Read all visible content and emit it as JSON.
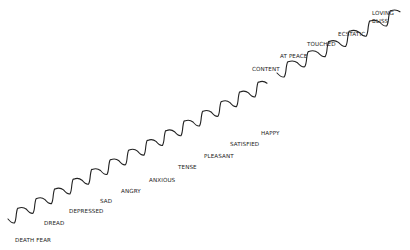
{
  "diagram": {
    "type": "emotional-scale-staircase",
    "line_color": "#222222",
    "text_color": "#222222",
    "lower_path": {
      "start": [
        8,
        219
      ],
      "steps": 14,
      "step_dx": 18.5,
      "step_dy": -9.7
    },
    "upper_path": {
      "start": [
        277,
        73
      ],
      "steps": 6,
      "step_dx": 20.5,
      "step_dy": -10.2
    },
    "labels": [
      {
        "text": "DEATH FEAR",
        "x": 15,
        "y": 237
      },
      {
        "text": "DREAD",
        "x": 44,
        "y": 220
      },
      {
        "text": "DEPRESSED",
        "x": 69,
        "y": 208
      },
      {
        "text": "SAD",
        "x": 100,
        "y": 198
      },
      {
        "text": "ANGRY",
        "x": 121,
        "y": 188
      },
      {
        "text": "ANXIOUS",
        "x": 149,
        "y": 177
      },
      {
        "text": "TENSE",
        "x": 178,
        "y": 164
      },
      {
        "text": "PLEASANT",
        "x": 204,
        "y": 153
      },
      {
        "text": "SATISFIED",
        "x": 230,
        "y": 141
      },
      {
        "text": "HAPPY",
        "x": 261,
        "y": 130
      },
      {
        "text": "CONTENT",
        "x": 252,
        "y": 66
      },
      {
        "text": "AT PEACE",
        "x": 280,
        "y": 53
      },
      {
        "text": "TOUCHED",
        "x": 307,
        "y": 41
      },
      {
        "text": "ECSTATIC",
        "x": 338,
        "y": 31
      },
      {
        "text": "LOVING",
        "x": 372,
        "y": 10
      },
      {
        "text": "BLISS",
        "x": 372,
        "y": 18
      }
    ]
  }
}
